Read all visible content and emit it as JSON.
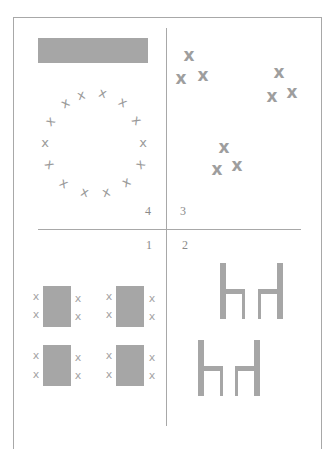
{
  "diagram": {
    "panels": [
      {
        "id": 4,
        "label": "4",
        "content": "banner bar above a circle of 14 scattered x marks"
      },
      {
        "id": 3,
        "label": "3",
        "content": "three clusters of three x marks"
      },
      {
        "id": 1,
        "label": "1",
        "content": "four rectangles (tables) each flanked by two x marks on each side"
      },
      {
        "id": 2,
        "label": "2",
        "content": "two pairs of facing chairs (side view)"
      }
    ],
    "colors": {
      "line": "#a8a8a8",
      "fill": "#a6a6a6",
      "mark": "#9a9a9a",
      "label": "#8a8a8a"
    },
    "mark_glyph": "x"
  }
}
